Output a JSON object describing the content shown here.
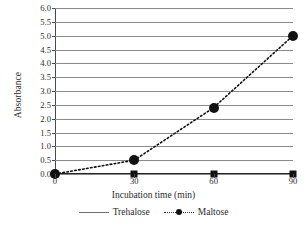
{
  "chart_data": {
    "type": "line",
    "title": "",
    "subtitle": "",
    "xlabel": "Incubation time (min)",
    "ylabel": "Absorbance",
    "x": [
      0,
      30,
      60,
      90
    ],
    "xtick_labels": [
      "0",
      "30",
      "60",
      "90"
    ],
    "xlim": [
      0,
      90
    ],
    "ytick_labels": [
      "0.0",
      "0.5",
      "1.0",
      "1.5",
      "2.0",
      "2.5",
      "3.0",
      "3.5",
      "4.0",
      "4.5",
      "5.0",
      "5.5",
      "6.0"
    ],
    "ytick_values": [
      0.0,
      0.5,
      1.0,
      1.5,
      2.0,
      2.5,
      3.0,
      3.5,
      4.0,
      4.5,
      5.0,
      5.5,
      6.0
    ],
    "ylim": [
      0.0,
      6.0
    ],
    "grid": "horizontal",
    "legend_position": "bottom",
    "series": [
      {
        "name": "Trehalose",
        "values": [
          0.0,
          0.0,
          0.0,
          0.0
        ],
        "line_style": "solid",
        "marker": "square",
        "color": "#111111"
      },
      {
        "name": "Maltose",
        "values": [
          0.0,
          0.5,
          2.4,
          5.0
        ],
        "line_style": "dotted",
        "marker": "circle",
        "color": "#111111"
      }
    ]
  },
  "legend": {
    "entries": [
      {
        "label": "Trehalose"
      },
      {
        "label": "Maltose"
      }
    ]
  },
  "axes": {
    "x_title": "Incubation time (min)",
    "y_title": "Absorbance"
  },
  "colors": {
    "gridline": "#8b8b8b",
    "axis": "#4a4a4a",
    "marker": "#111111",
    "text": "#2b2b2b",
    "background": "#ffffff"
  }
}
